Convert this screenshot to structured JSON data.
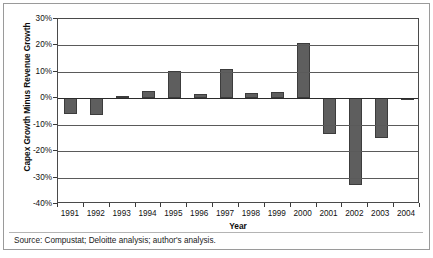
{
  "chart_data": {
    "type": "bar",
    "title": "",
    "xlabel": "Year",
    "ylabel": "Capex Growth Minus Revenue Growth",
    "categories": [
      "1991",
      "1992",
      "1993",
      "1994",
      "1995",
      "1996",
      "1997",
      "1998",
      "1999",
      "2000",
      "2001",
      "2002",
      "2003",
      "2004"
    ],
    "values": [
      -6.0,
      -6.5,
      0.7,
      2.8,
      10.3,
      1.5,
      11.0,
      2.0,
      2.3,
      20.8,
      -13.5,
      -33.0,
      -15.0,
      -0.5
    ],
    "ylim": [
      -40,
      30
    ],
    "yticks": [
      30,
      20,
      10,
      0,
      -10,
      -20,
      -30,
      -40
    ],
    "ytick_labels": [
      "30%",
      "20%",
      "10%",
      "0%",
      "-10%",
      "-20%",
      "-30%",
      "-40%"
    ],
    "grid": true,
    "legend": "none",
    "bar_color": "#5e5e5e",
    "bar_edge_color": "#3c3c3c"
  },
  "footer": {
    "source": "Source: Compustat; Deloitte analysis; author's analysis."
  }
}
